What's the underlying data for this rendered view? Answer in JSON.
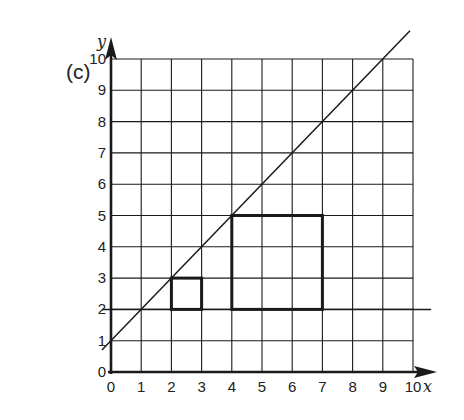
{
  "part_label": "(c)",
  "axes": {
    "x_label": "x",
    "y_label": "y",
    "x_ticks": [
      "0",
      "1",
      "2",
      "3",
      "4",
      "5",
      "6",
      "7",
      "8",
      "9",
      "10"
    ],
    "y_ticks": [
      "0",
      "1",
      "2",
      "3",
      "4",
      "5",
      "6",
      "7",
      "8",
      "9",
      "10"
    ],
    "x_range": [
      0,
      10
    ],
    "y_range": [
      0,
      10
    ],
    "grid": true
  },
  "chart_data": {
    "type": "diagram",
    "title": "(c)",
    "xlabel": "x",
    "ylabel": "y",
    "xlim": [
      0,
      10
    ],
    "ylim": [
      0,
      10
    ],
    "grid": true,
    "lines": [
      {
        "name": "y = x + 1",
        "from": [
          -0.3,
          0.7
        ],
        "to": [
          9.9,
          10.9
        ]
      },
      {
        "name": "y = 2",
        "from": [
          -0.3,
          2
        ],
        "to": [
          10.6,
          2
        ]
      }
    ],
    "rectangles": [
      {
        "name": "small square",
        "x": [
          2,
          3
        ],
        "y": [
          2,
          3
        ]
      },
      {
        "name": "large square",
        "x": [
          4,
          7
        ],
        "y": [
          2,
          5
        ]
      }
    ]
  },
  "colors": {
    "ink": "#1a1a1a",
    "background": "#ffffff"
  }
}
